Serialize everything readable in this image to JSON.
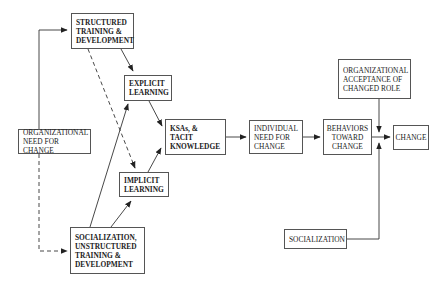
{
  "diagram": {
    "nodes": {
      "structured_training": {
        "label": "STRUCTURED\nTRAINING &\nDEVELOPMENT",
        "bold": true
      },
      "explicit_learning": {
        "label": "EXPLICIT\nLEARNING",
        "bold": true
      },
      "org_need": {
        "label": "ORGANIZATIONAL\nNEED FOR CHANGE",
        "bold": false
      },
      "ksas": {
        "label": "KSAs, &\nTACIT\nKNOWLEDGE",
        "bold": true
      },
      "individual_need": {
        "label": "INDIVIDUAL\nNEED FOR\nCHANGE",
        "bold": false
      },
      "behaviors": {
        "label": "BEHAVIORS\nTOWARD\nCHANGE",
        "bold": false
      },
      "change": {
        "label": "CHANGE",
        "bold": false
      },
      "org_acceptance": {
        "label": "ORGANIZATIONAL\nACCEPTANCE OF\nCHANGED ROLE",
        "bold": false
      },
      "implicit_learning": {
        "label": "IMPLICIT\nLEARNING",
        "bold": true
      },
      "socialization_unstructured": {
        "label": "SOCIALIZATION,\nUNSTRUCTURED\nTRAINING &\nDEVELOPMENT",
        "bold": true
      },
      "socialization": {
        "label": "SOCIALIZATION",
        "bold": false
      }
    },
    "edges": [
      {
        "from": "org_need",
        "to": "structured_training",
        "style": "solid"
      },
      {
        "from": "org_need",
        "to": "socialization_unstructured",
        "style": "dashed"
      },
      {
        "from": "structured_training",
        "to": "explicit_learning",
        "style": "solid"
      },
      {
        "from": "structured_training",
        "to": "implicit_learning",
        "style": "dashed"
      },
      {
        "from": "socialization_unstructured",
        "to": "explicit_learning",
        "style": "solid"
      },
      {
        "from": "socialization_unstructured",
        "to": "implicit_learning",
        "style": "solid"
      },
      {
        "from": "explicit_learning",
        "to": "ksas",
        "style": "solid"
      },
      {
        "from": "implicit_learning",
        "to": "ksas",
        "style": "solid"
      },
      {
        "from": "ksas",
        "to": "individual_need",
        "style": "solid"
      },
      {
        "from": "individual_need",
        "to": "behaviors",
        "style": "solid"
      },
      {
        "from": "behaviors",
        "to": "change",
        "style": "solid"
      },
      {
        "from": "org_acceptance",
        "to": "change",
        "style": "solid"
      },
      {
        "from": "socialization",
        "to": "change",
        "style": "solid"
      }
    ]
  },
  "colors": {
    "line": "#333333",
    "box_border": "#555555",
    "text": "#222222",
    "background": "#ffffff"
  }
}
